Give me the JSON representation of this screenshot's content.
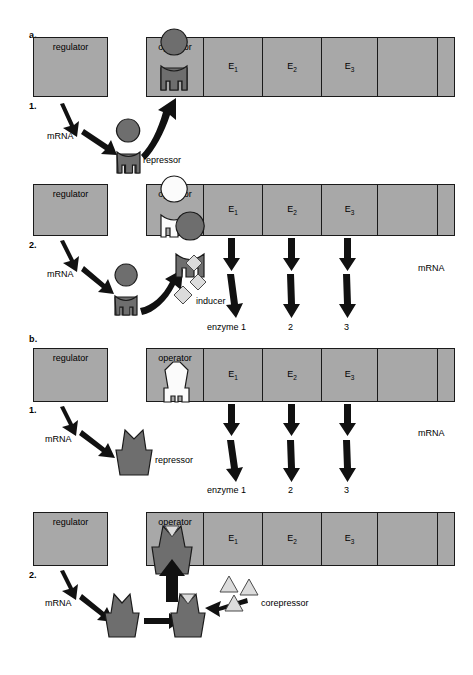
{
  "figure": {
    "gray_fill": "#a8a8a8",
    "protein_fill": "#6e6e6e",
    "effector_fill": "#dcdcdc"
  },
  "panels": [
    {
      "letter": "a.",
      "number": "1.",
      "state": "repressor-bound-operator",
      "regulator_label": "regulator",
      "operon": [
        {
          "name": "operator",
          "label": "operator"
        },
        {
          "name": "gene-e1",
          "label": "E",
          "sub": "1"
        },
        {
          "name": "gene-e2",
          "label": "E",
          "sub": "2"
        },
        {
          "name": "gene-e3",
          "label": "E",
          "sub": "3"
        },
        {
          "name": "gene-blank",
          "label": ""
        },
        {
          "name": "gene-terminus",
          "label": ""
        }
      ],
      "mrna_label": "mRNA",
      "repressor_label": "repressor",
      "right_mrna_label": "",
      "enzyme_labels": []
    },
    {
      "letter": "",
      "number": "2.",
      "state": "inducer-inactivates-repressor",
      "regulator_label": "regulator",
      "operon": [
        {
          "name": "operator",
          "label": "operator"
        },
        {
          "name": "gene-e1",
          "label": "E",
          "sub": "1"
        },
        {
          "name": "gene-e2",
          "label": "E",
          "sub": "2"
        },
        {
          "name": "gene-e3",
          "label": "E",
          "sub": "3"
        },
        {
          "name": "gene-blank",
          "label": ""
        },
        {
          "name": "gene-terminus",
          "label": ""
        }
      ],
      "mrna_label": "mRNA",
      "inducer_label": "inducer",
      "right_mrna_label": "mRNA",
      "enzyme_labels": [
        "enzyme 1",
        "2",
        "3"
      ]
    },
    {
      "letter": "b.",
      "number": "1.",
      "state": "inactive-repressor-operator-free",
      "regulator_label": "regulator",
      "operon": [
        {
          "name": "operator",
          "label": "operator"
        },
        {
          "name": "gene-e1",
          "label": "E",
          "sub": "1"
        },
        {
          "name": "gene-e2",
          "label": "E",
          "sub": "2"
        },
        {
          "name": "gene-e3",
          "label": "E",
          "sub": "3"
        },
        {
          "name": "gene-blank",
          "label": ""
        },
        {
          "name": "gene-terminus",
          "label": ""
        }
      ],
      "mrna_label": "mRNA",
      "repressor_label": "repressor",
      "right_mrna_label": "mRNA",
      "enzyme_labels": [
        "enzyme 1",
        "2",
        "3"
      ]
    },
    {
      "letter": "",
      "number": "2.",
      "state": "corepressor-activates-repressor",
      "regulator_label": "regulator",
      "operon": [
        {
          "name": "operator",
          "label": "operator"
        },
        {
          "name": "gene-e1",
          "label": "E",
          "sub": "1"
        },
        {
          "name": "gene-e2",
          "label": "E",
          "sub": "2"
        },
        {
          "name": "gene-e3",
          "label": "E",
          "sub": "3"
        },
        {
          "name": "gene-blank",
          "label": ""
        },
        {
          "name": "gene-terminus",
          "label": ""
        }
      ],
      "mrna_label": "mRNA",
      "corepressor_label": "corepressor",
      "right_mrna_label": "",
      "enzyme_labels": []
    }
  ]
}
